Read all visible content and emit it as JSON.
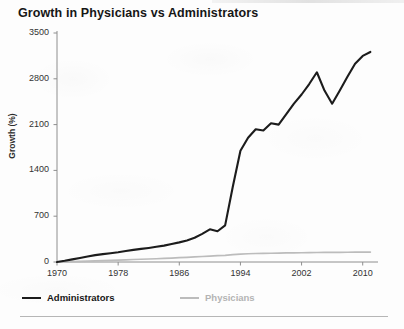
{
  "chart_data": {
    "type": "line",
    "title": "Growth in Physicians vs Administrators",
    "xlabel": "",
    "ylabel": "Growth (%)",
    "xlim": [
      1970,
      2012
    ],
    "ylim": [
      0,
      3500
    ],
    "grid": false,
    "legend_position": "bottom",
    "xticks": [
      "1970",
      "1978",
      "1986",
      "1994",
      "2002",
      "2010"
    ],
    "xtick_values": [
      1970,
      1978,
      1986,
      1994,
      2002,
      2010
    ],
    "yticks": [
      "0",
      "700",
      "1400",
      "2100",
      "2800",
      "3500"
    ],
    "ytick_values": [
      0,
      700,
      1400,
      2100,
      2800,
      3500
    ],
    "x": [
      1970,
      1971,
      1972,
      1973,
      1974,
      1975,
      1976,
      1977,
      1978,
      1979,
      1980,
      1981,
      1982,
      1983,
      1984,
      1985,
      1986,
      1987,
      1988,
      1989,
      1990,
      1991,
      1992,
      1993,
      1994,
      1995,
      1996,
      1997,
      1998,
      1999,
      2000,
      2001,
      2002,
      2003,
      2004,
      2005,
      2006,
      2007,
      2008,
      2009,
      2010,
      2011
    ],
    "series": [
      {
        "name": "Administrators",
        "color": "#1c1c1c",
        "values": [
          0,
          18,
          40,
          62,
          85,
          105,
          120,
          135,
          150,
          168,
          185,
          200,
          215,
          232,
          250,
          275,
          300,
          330,
          370,
          430,
          500,
          470,
          560,
          1150,
          1700,
          1900,
          2030,
          2010,
          2120,
          2100,
          2260,
          2420,
          2560,
          2720,
          2900,
          2620,
          2420,
          2620,
          2830,
          3030,
          3150,
          3210
        ]
      },
      {
        "name": "Physicians",
        "color": "#bcbcbc",
        "values": [
          0,
          3,
          6,
          9,
          13,
          17,
          21,
          25,
          30,
          34,
          38,
          42,
          46,
          50,
          55,
          60,
          66,
          72,
          78,
          84,
          90,
          96,
          102,
          112,
          120,
          126,
          130,
          132,
          134,
          136,
          138,
          140,
          141,
          143,
          145,
          146,
          147,
          148,
          149,
          150,
          151,
          152
        ]
      }
    ]
  },
  "legend": [
    {
      "label": "Administrators",
      "color": "#1c1c1c"
    },
    {
      "label": "Physicians",
      "color": "#bcbcbc"
    }
  ],
  "footer": {
    "note": ""
  }
}
